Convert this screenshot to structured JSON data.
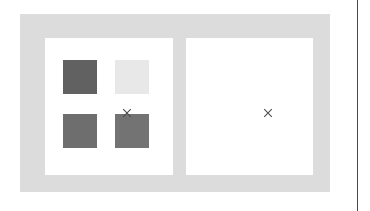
{
  "page": {
    "background_color": "#ffffff",
    "width": 370,
    "height": 211,
    "rule_color": "#4a4a4a"
  },
  "frame": {
    "name": "comparison-frame",
    "background_color": "#dcdcdc"
  },
  "panels": [
    {
      "id": "left",
      "name": "swatch-panel",
      "background_color": "#ffffff",
      "marker": "×",
      "marker_color": "#4d4d4d",
      "swatches": [
        {
          "position": "top-left",
          "color": "#616161"
        },
        {
          "position": "top-right",
          "color": "#e8e8e8"
        },
        {
          "position": "bottom-left",
          "color": "#6e6e6e"
        },
        {
          "position": "bottom-right",
          "color": "#737373"
        }
      ]
    },
    {
      "id": "right",
      "name": "empty-panel",
      "background_color": "#ffffff",
      "marker": "×",
      "marker_color": "#4d4d4d",
      "swatches": []
    }
  ],
  "icons": {
    "cross": "cross-marker-icon"
  }
}
